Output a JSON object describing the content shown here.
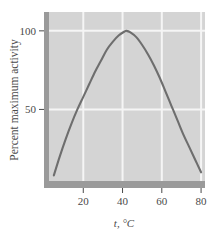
{
  "figure": {
    "name": "enzyme-activity-vs-temperature",
    "background_color": "#ffffff",
    "plot_background_color": "#d4d4d4",
    "grid_color": "#f5f5f5",
    "axis_band_color": "#9a9a9a",
    "curve_color": "#6e6e6e",
    "text_color": "#4a4a4a"
  },
  "chart_data": {
    "type": "line",
    "title": "",
    "subtitle": "",
    "xlabel": "t, °C",
    "ylabel": "Percent maximum activity",
    "xlim": [
      0,
      82
    ],
    "ylim": [
      0,
      112
    ],
    "grid": true,
    "legend": null,
    "x_ticks": [
      20,
      40,
      60,
      80
    ],
    "x_tick_labels": [
      "20",
      "40",
      "60",
      "80"
    ],
    "y_ticks": [
      50,
      100
    ],
    "y_tick_labels": [
      "50",
      "100"
    ],
    "series": [
      {
        "name": "Percent maximum activity",
        "color": "#6e6e6e",
        "x": [
          5,
          8,
          11,
          14,
          17,
          20,
          23,
          26,
          29,
          32,
          35,
          38,
          41,
          42,
          44,
          47,
          50,
          53,
          56,
          59,
          62,
          65,
          68,
          71,
          74,
          77,
          80
        ],
        "y": [
          8,
          20,
          31,
          41,
          50,
          58,
          66,
          74,
          81,
          88,
          93,
          97,
          99.6,
          100,
          99,
          96,
          91,
          85,
          78,
          70,
          61,
          52,
          43,
          34,
          26,
          18,
          10
        ]
      }
    ],
    "annotations": [
      {
        "text": "peak activity near 42 °C",
        "x": 42,
        "y": 100
      }
    ]
  },
  "labels": {
    "y_axis_title": "Percent maximum activity",
    "x_axis_title": "t, °C",
    "x_axis_title_symbol": "t",
    "x_axis_title_unit": ", °C"
  }
}
